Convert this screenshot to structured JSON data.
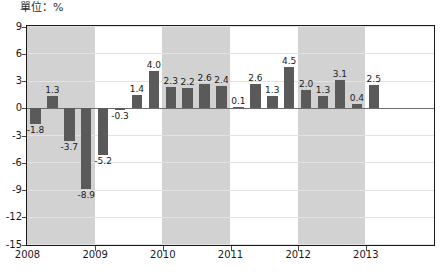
{
  "unit_label": "單位：%",
  "chart_data": {
    "type": "bar",
    "title": "",
    "subtitle": "",
    "xlabel": "",
    "ylabel": "",
    "unit": "%",
    "ylim": [
      -15,
      9
    ],
    "yticks": [
      9,
      6,
      3,
      0,
      -3,
      -6,
      -9,
      -12,
      -15
    ],
    "ytick_labels": [
      "9",
      "6",
      "3",
      "0",
      "-3",
      "-6",
      "-9",
      "-12",
      "-15"
    ],
    "grid": true,
    "legend": "none",
    "xticks": [
      2008,
      2009,
      2010,
      2011,
      2012,
      2013
    ],
    "xtick_labels": [
      "2008",
      "2009",
      "2010",
      "2011",
      "2012",
      "2013"
    ],
    "categories": [
      "2008Q1",
      "2008Q2",
      "2008Q3",
      "2008Q4",
      "2009Q1",
      "2009Q2",
      "2009Q3",
      "2009Q4",
      "2010Q1",
      "2010Q2",
      "2010Q3",
      "2010Q4",
      "2011Q1",
      "2011Q2",
      "2011Q3",
      "2011Q4",
      "2012Q1",
      "2012Q2",
      "2012Q3",
      "2012Q4",
      "2013Q1"
    ],
    "values": [
      -1.8,
      1.3,
      -3.7,
      -8.9,
      -5.2,
      -0.3,
      1.4,
      4.0,
      2.3,
      2.2,
      2.6,
      2.4,
      0.1,
      2.6,
      1.3,
      4.5,
      2.0,
      1.3,
      3.1,
      0.4,
      2.5
    ],
    "value_labels": [
      "-1.8",
      "1.3",
      "-3.7",
      "-8.9",
      "-5.2",
      "-0.3",
      "1.4",
      "4.0",
      "2.3",
      "2.2",
      "2.6",
      "2.4",
      "0.1",
      "2.6",
      "1.3",
      "4.5",
      "2.0",
      "1.3",
      "3.1",
      "0.4",
      "2.5"
    ],
    "bar_color": "#5a5a5a",
    "band_color": "#d2d2d2",
    "shaded_year_bands": [
      "2008",
      "2010",
      "2012"
    ]
  }
}
